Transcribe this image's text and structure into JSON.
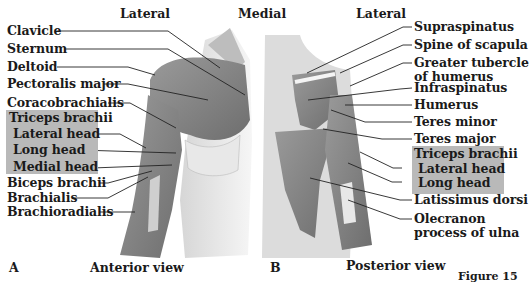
{
  "panel_a": {
    "letter": "A",
    "view": "Anterior view",
    "top_labels": {
      "lateral": "Lateral",
      "medial": "Medial"
    },
    "labels": [
      "Clavicle",
      "Sternum",
      "Deltoid",
      "Pectoralis major",
      "Coracobrachialis"
    ],
    "triceps_group": {
      "title": "Triceps brachii",
      "heads": [
        "Lateral head",
        "Long head",
        "Medial head"
      ]
    },
    "lower_labels": [
      "Biceps brachii",
      "Brachialis",
      "Brachioradialis"
    ]
  },
  "panel_b": {
    "letter": "B",
    "view": "Posterior view",
    "top_labels": {
      "lateral": "Lateral"
    },
    "labels": [
      "Supraspinatus",
      "Spine of scapula",
      "Greater tubercle",
      "of humerus",
      "Infraspinatus",
      "Humerus",
      "Teres minor",
      "Teres major"
    ],
    "triceps_group": {
      "title": "Triceps brachii",
      "heads": [
        "Lateral head",
        "Long head"
      ]
    },
    "lower_labels": [
      "Latissimus dorsi",
      "Olecranon",
      "process of ulna"
    ]
  },
  "footer_fragment": "Figure 15",
  "colors": {
    "highlight_box": "#b9b9b9",
    "muscle": "#8a8a8a",
    "skin": "#e4e4e4",
    "leader": "#222222"
  }
}
